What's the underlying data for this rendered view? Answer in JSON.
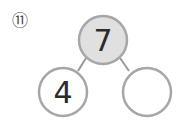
{
  "problem": {
    "number_label": "⑪"
  },
  "number_bond": {
    "whole": "7",
    "parts": [
      "4",
      ""
    ],
    "colors": {
      "whole_fill": "#e0e0e0",
      "part_fill": "#ffffff",
      "stroke": "#999999",
      "text": "#2b2b2b"
    }
  }
}
